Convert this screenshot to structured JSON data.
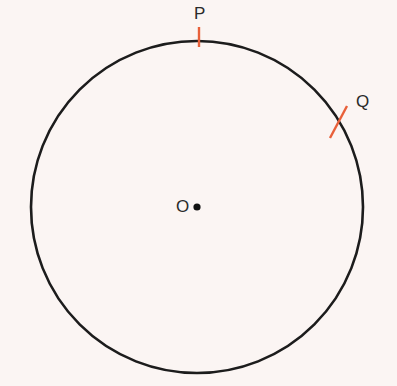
{
  "diagram": {
    "type": "circle-geometry",
    "background_color": "#fbf5f3",
    "circle": {
      "center_x": 197,
      "center_y": 207,
      "radius": 166,
      "stroke_color": "#1c1c1c",
      "stroke_width": 2.6
    },
    "center_point": {
      "label": "O",
      "x": 197,
      "y": 207,
      "radius": 3.6,
      "color": "#111111"
    },
    "points_on_circle": [
      {
        "label": "P",
        "tick": {
          "x1": 199,
          "y1": 27,
          "x2": 199,
          "y2": 47
        },
        "label_x": 194,
        "label_y": 5
      },
      {
        "label": "Q",
        "tick": {
          "x1": 347,
          "y1": 106,
          "x2": 330,
          "y2": 138
        },
        "label_x": 356,
        "label_y": 93
      }
    ],
    "tick_color": "#e8603a",
    "tick_width": 2.4
  }
}
